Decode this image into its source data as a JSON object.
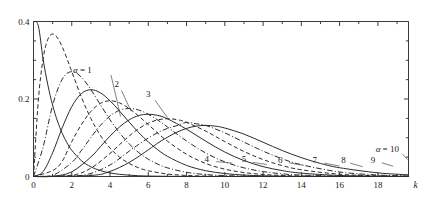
{
  "chart_data": {
    "type": "line",
    "title": "",
    "subtitle": "",
    "xlabel": "k",
    "ylabel": "",
    "xlim": [
      0,
      19.6
    ],
    "ylim": [
      0,
      0.4
    ],
    "grid": false,
    "legend_position": "inline-curve-labels",
    "x_ticks": [
      0,
      2,
      4,
      6,
      8,
      10,
      12,
      14,
      16,
      18
    ],
    "x_tick_labels": [
      "0",
      "2",
      "4",
      "6",
      "8",
      "10",
      "12",
      "14",
      "16",
      "18"
    ],
    "x_minor_ticks": [
      1,
      3,
      5,
      7,
      9,
      11,
      13,
      15,
      17,
      19
    ],
    "y_ticks": [
      0,
      0.2,
      0.4
    ],
    "y_tick_labels": [
      "0",
      "0.2",
      "0.4"
    ],
    "y_minor_ticks": [
      0.05,
      0.1,
      0.15,
      0.25,
      0.3,
      0.35
    ],
    "series": [
      {
        "name": "alpha = 1",
        "alpha": 1,
        "label": "α = 1",
        "label_is_alpha": true,
        "linestyle": "solid",
        "peak_x": 0,
        "peak_y": 0.4,
        "label_x": 3.05,
        "label_y": 0.268,
        "leader": [
          [
            4.05,
            0.262
          ],
          [
            4.55,
            0.155
          ]
        ],
        "x": [
          0,
          0.25,
          0.5,
          0.75,
          1,
          1.25,
          1.5,
          1.75,
          2,
          2.5,
          3,
          3.5,
          4,
          4.5,
          5,
          5.5,
          6,
          7,
          8,
          9,
          10,
          11,
          12,
          14,
          16,
          18,
          19.6
        ],
        "y": [
          0.4,
          0.3894,
          0.3033,
          0.2362,
          0.1839,
          0.1433,
          0.1116,
          0.0869,
          0.0677,
          0.041,
          0.0249,
          0.0151,
          0.0092,
          0.0056,
          0.0034,
          0.002,
          0.0012,
          0.0005,
          0.0002,
          0.0001,
          0.0,
          0.0,
          0.0,
          0.0,
          0.0,
          0.0,
          0.0
        ]
      },
      {
        "name": "alpha = 2",
        "alpha": 2,
        "label": "2",
        "label_is_alpha": false,
        "linestyle": "dashed",
        "peak_x": 1,
        "peak_y": 0.3679,
        "label_x": 4.35,
        "label_y": 0.232,
        "leader": [
          [
            4.6,
            0.222
          ],
          [
            5.1,
            0.168
          ]
        ],
        "x": [
          0,
          0.25,
          0.5,
          0.75,
          1,
          1.25,
          1.5,
          1.75,
          2,
          2.5,
          3,
          3.5,
          4,
          4.5,
          5,
          5.5,
          6,
          7,
          8,
          9,
          10,
          11,
          12,
          14,
          16,
          18,
          19.6
        ],
        "y": [
          0,
          0.1947,
          0.3033,
          0.3543,
          0.3679,
          0.3581,
          0.3347,
          0.3041,
          0.2707,
          0.2052,
          0.1494,
          0.1057,
          0.0733,
          0.05,
          0.0337,
          0.0224,
          0.0149,
          0.0064,
          0.0027,
          0.0011,
          0.0005,
          0.0002,
          0.0001,
          0.0,
          0.0,
          0.0,
          0.0
        ]
      },
      {
        "name": "alpha = 3",
        "alpha": 3,
        "label": "3",
        "label_is_alpha": false,
        "linestyle": "dashdot",
        "peak_x": 2,
        "peak_y": 0.2707,
        "label_x": 6.0,
        "label_y": 0.205,
        "leader": [
          [
            6.35,
            0.197
          ],
          [
            7.0,
            0.152
          ]
        ],
        "x": [
          0,
          0.5,
          1,
          1.5,
          2,
          2.5,
          3,
          3.5,
          4,
          4.5,
          5,
          5.5,
          6,
          6.5,
          7,
          8,
          9,
          10,
          11,
          12,
          14,
          16,
          18,
          19.6
        ],
        "y": [
          0,
          0.0758,
          0.1839,
          0.251,
          0.2707,
          0.2565,
          0.224,
          0.185,
          0.1465,
          0.1125,
          0.0842,
          0.0618,
          0.0446,
          0.0318,
          0.0223,
          0.0107,
          0.005,
          0.0023,
          0.001,
          0.0004,
          0.0001,
          0.0,
          0.0,
          0.0
        ]
      },
      {
        "name": "alpha = 4",
        "alpha": 4,
        "label": "4",
        "label_is_alpha": false,
        "linestyle": "solid",
        "peak_x": 3,
        "peak_y": 0.224,
        "label_x": 9.05,
        "label_y": 0.0385,
        "leader": [
          [
            9.55,
            0.0385
          ],
          [
            10.4,
            0.0345
          ]
        ],
        "x": [
          0,
          0.5,
          1,
          1.5,
          2,
          2.5,
          3,
          3.5,
          4,
          4.5,
          5,
          5.5,
          6,
          6.5,
          7,
          8,
          9,
          10,
          11,
          12,
          13,
          14,
          16,
          18,
          19.6
        ],
        "y": [
          0,
          0.0126,
          0.0613,
          0.1255,
          0.1804,
          0.2138,
          0.224,
          0.2158,
          0.1954,
          0.1687,
          0.1404,
          0.1133,
          0.0892,
          0.0688,
          0.0521,
          0.0286,
          0.015,
          0.0076,
          0.0037,
          0.0018,
          0.0008,
          0.0004,
          0.0001,
          0.0,
          0.0
        ]
      },
      {
        "name": "alpha = 5",
        "alpha": 5,
        "label": "5",
        "label_is_alpha": false,
        "linestyle": "dashed",
        "peak_x": 4,
        "peak_y": 0.1954,
        "label_x": 11.0,
        "label_y": 0.0365,
        "leader": [
          [
            11.45,
            0.0365
          ],
          [
            12.2,
            0.031
          ]
        ],
        "x": [
          0,
          1,
          1.5,
          2,
          2.5,
          3,
          3.5,
          4,
          4.5,
          5,
          5.5,
          6,
          6.5,
          7,
          8,
          9,
          10,
          11,
          12,
          13,
          14,
          16,
          18,
          19.6
        ],
        "y": [
          0,
          0.0153,
          0.0393,
          0.0902,
          0.1336,
          0.168,
          0.1888,
          0.1954,
          0.1898,
          0.1755,
          0.1558,
          0.1339,
          0.1118,
          0.0912,
          0.0573,
          0.0337,
          0.0189,
          0.0102,
          0.0053,
          0.0027,
          0.0013,
          0.0003,
          0.0001,
          0.0
        ]
      },
      {
        "name": "alpha = 6",
        "alpha": 6,
        "label": "6",
        "label_is_alpha": false,
        "linestyle": "dashdot",
        "peak_x": 5,
        "peak_y": 0.1755,
        "label_x": 12.9,
        "label_y": 0.0355,
        "leader": [
          [
            13.35,
            0.0355
          ],
          [
            14.1,
            0.029
          ]
        ],
        "x": [
          0,
          1,
          2,
          2.5,
          3,
          3.5,
          4,
          4.5,
          5,
          5.5,
          6,
          6.5,
          7,
          8,
          9,
          10,
          11,
          12,
          13,
          14,
          16,
          18,
          19.6
        ],
        "y": [
          0,
          0.0031,
          0.0361,
          0.0668,
          0.1008,
          0.1322,
          0.1563,
          0.1708,
          0.1755,
          0.1716,
          0.1606,
          0.1454,
          0.1277,
          0.0916,
          0.0607,
          0.0378,
          0.0223,
          0.0127,
          0.0069,
          0.0037,
          0.0009,
          0.0002,
          0.0001
        ]
      },
      {
        "name": "alpha = 7",
        "alpha": 7,
        "label": "7",
        "label_is_alpha": false,
        "linestyle": "solid",
        "peak_x": 6,
        "peak_y": 0.1606,
        "label_x": 14.7,
        "label_y": 0.0345,
        "leader": [
          [
            15.2,
            0.0345
          ],
          [
            16.0,
            0.027
          ]
        ],
        "x": [
          0,
          1,
          2,
          3,
          3.5,
          4,
          4.5,
          5,
          5.5,
          6,
          6.5,
          7,
          8,
          9,
          10,
          11,
          12,
          13,
          14,
          16,
          18,
          19.6
        ],
        "y": [
          0,
          0.0005,
          0.012,
          0.0504,
          0.0771,
          0.1042,
          0.1281,
          0.1462,
          0.1573,
          0.1606,
          0.1576,
          0.149,
          0.1221,
          0.0911,
          0.0631,
          0.0411,
          0.0255,
          0.0152,
          0.0087,
          0.0026,
          0.0007,
          0.0002
        ]
      },
      {
        "name": "alpha = 8",
        "alpha": 8,
        "label": "8",
        "label_is_alpha": false,
        "linestyle": "dashed",
        "peak_x": 7,
        "peak_y": 0.149,
        "label_x": 16.2,
        "label_y": 0.0345,
        "leader": [
          [
            16.55,
            0.0345
          ],
          [
            17.2,
            0.0255
          ]
        ],
        "x": [
          0,
          2,
          3,
          4,
          4.5,
          5,
          5.5,
          6,
          6.5,
          7,
          7.5,
          8,
          9,
          10,
          11,
          12,
          13,
          14,
          16,
          18,
          19.6
        ],
        "y": [
          0,
          0.0034,
          0.0216,
          0.0595,
          0.0824,
          0.1044,
          0.1235,
          0.1377,
          0.1462,
          0.149,
          0.1468,
          0.1396,
          0.1171,
          0.0901,
          0.0646,
          0.0437,
          0.0281,
          0.0174,
          0.0058,
          0.0018,
          0.0006
        ]
      },
      {
        "name": "alpha = 9",
        "alpha": 9,
        "label": "9",
        "label_is_alpha": false,
        "linestyle": "dashdot",
        "peak_x": 8,
        "peak_y": 0.1396,
        "label_x": 17.75,
        "label_y": 0.0355,
        "leader": [
          [
            18.2,
            0.0355
          ],
          [
            18.8,
            0.0265
          ]
        ],
        "x": [
          0,
          2,
          3,
          4,
          5,
          5.5,
          6,
          6.5,
          7,
          7.5,
          8,
          8.5,
          9,
          10,
          11,
          12,
          13,
          14,
          16,
          18,
          19.6
        ],
        "y": [
          0,
          0.0009,
          0.0081,
          0.0298,
          0.0653,
          0.083,
          0.0993,
          0.1133,
          0.1241,
          0.1313,
          0.1396,
          0.136,
          0.1318,
          0.1126,
          0.0887,
          0.0655,
          0.0457,
          0.0304,
          0.0116,
          0.0039,
          0.0014
        ]
      },
      {
        "name": "alpha = 10",
        "alpha": 10,
        "label": "α = 10",
        "label_is_alpha": true,
        "linestyle": "solid",
        "peak_x": 9,
        "peak_y": 0.1318,
        "label_x": 19.1,
        "label_y": 0.062,
        "leader": [
          [
            19.3,
            0.057
          ],
          [
            19.55,
            0.0435
          ]
        ],
        "x": [
          0,
          3,
          4,
          5,
          6,
          6.5,
          7,
          7.5,
          8,
          8.5,
          9,
          9.5,
          10,
          11,
          12,
          13,
          14,
          15,
          16,
          18,
          19.6
        ],
        "y": [
          0,
          0.0027,
          0.0132,
          0.0363,
          0.0688,
          0.0864,
          0.1014,
          0.1144,
          0.1241,
          0.13,
          0.1318,
          0.13,
          0.1251,
          0.1094,
          0.0883,
          0.0671,
          0.0486,
          0.0337,
          0.0226,
          0.0094,
          0.0043
        ]
      }
    ]
  },
  "figure": {
    "caption": "",
    "axis_color": "#3a3a3a",
    "curve_color": "#2b2b2b",
    "background": "#ffffff"
  }
}
